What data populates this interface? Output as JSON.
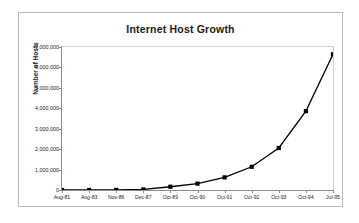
{
  "chart_data": {
    "type": "line",
    "title": "Internet Host Growth",
    "xlabel": "",
    "ylabel": "Number of Hosts",
    "categories": [
      "Aug-81",
      "Aug-83",
      "Nov-86",
      "Dec-87",
      "Oct-89",
      "Oct-90",
      "Oct-91",
      "Oct-92",
      "Oct-93",
      "Oct-94",
      "Jul-95"
    ],
    "values": [
      213,
      562,
      5089,
      28174,
      159000,
      313000,
      617000,
      1136000,
      2056000,
      3864000,
      6642000
    ],
    "ylim": [
      0,
      7000000
    ],
    "ytick_labels": [
      "0",
      "1,000,000",
      "2,000,000",
      "3,000,000",
      "4,000,000",
      "5,000,000",
      "6,000,000",
      "7,000,000"
    ],
    "ytick_values": [
      0,
      1000000,
      2000000,
      3000000,
      4000000,
      5000000,
      6000000,
      7000000
    ],
    "grid": false,
    "legend": false,
    "marker": "square",
    "series_color": "#000000",
    "line_color": "#000000",
    "axis_color": "#8a8a8a",
    "frame_color": "#b9b9b9",
    "background": "#ffffff"
  }
}
